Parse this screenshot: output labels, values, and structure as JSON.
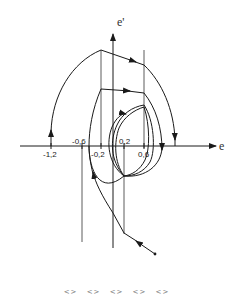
{
  "diagram": {
    "type": "phase-plane",
    "axes": {
      "x_label": "e",
      "y_label": "e'"
    },
    "ticks": [
      {
        "label": "-1,2",
        "value": -1.2,
        "position": "below"
      },
      {
        "label": "-0,6",
        "value": -0.6,
        "position": "above"
      },
      {
        "label": "-0,2",
        "value": -0.2,
        "position": "below"
      },
      {
        "label": "0,2",
        "value": 0.2,
        "position": "above"
      },
      {
        "label": "0,6",
        "value": 0.6,
        "position": "below"
      }
    ],
    "switching_lines": [
      "e = -0.6",
      "e = -0.2",
      "e = 0.2",
      "e = 0.6"
    ],
    "colors": {
      "stroke": "#1a1a1a",
      "background": "#ffffff"
    }
  },
  "pager": {
    "items": [
      "<>",
      "<>",
      "<>",
      "<>",
      "<>"
    ]
  }
}
